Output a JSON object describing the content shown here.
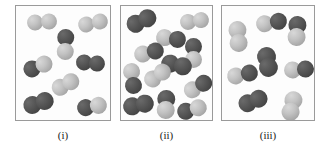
{
  "figure": {
    "type": "molecular-diagram",
    "background_color": "#ffffff",
    "panel_border_color": "#9a9a9a",
    "panel_fill_color": "#fdfdfd",
    "atom_colors": {
      "light": "#c3c3c3",
      "dark": "#575757",
      "mid": "#8b8b8b"
    },
    "panels": [
      {
        "id": "panel-i",
        "caption": "(i)",
        "box": {
          "x": 15,
          "y": 5,
          "width": 96,
          "height": 116
        },
        "molecule_count": 8,
        "molecules": [
          {
            "x": 11,
            "y": 8,
            "w": 30,
            "h": 16,
            "rot": -4,
            "left": "light",
            "right": "light"
          },
          {
            "x": 62,
            "y": 9,
            "w": 30,
            "h": 16,
            "rot": -12,
            "left": "light",
            "right": "light"
          },
          {
            "x": 41,
            "y": 23,
            "w": 17,
            "h": 31,
            "rot": 2,
            "left": "dark",
            "right": "light",
            "vertical": true
          },
          {
            "x": 7,
            "y": 52,
            "w": 30,
            "h": 17,
            "rot": -22,
            "left": "dark",
            "right": "light"
          },
          {
            "x": 60,
            "y": 49,
            "w": 29,
            "h": 16,
            "rot": 5,
            "left": "dark",
            "right": "dark"
          },
          {
            "x": 35,
            "y": 70,
            "w": 29,
            "h": 17,
            "rot": -28,
            "left": "light",
            "right": "light"
          },
          {
            "x": 7,
            "y": 88,
            "w": 31,
            "h": 18,
            "rot": -18,
            "left": "dark",
            "right": "dark"
          },
          {
            "x": 61,
            "y": 92,
            "w": 30,
            "h": 17,
            "rot": -10,
            "left": "dark",
            "right": "light"
          }
        ]
      },
      {
        "id": "panel-ii",
        "caption": "(ii)",
        "box": {
          "x": 120,
          "y": 5,
          "width": 93,
          "height": 116
        },
        "molecule_count": 12,
        "molecules": [
          {
            "x": 5,
            "y": 6,
            "w": 31,
            "h": 18,
            "rot": -25,
            "left": "dark",
            "right": "dark"
          },
          {
            "x": 59,
            "y": 7,
            "w": 29,
            "h": 16,
            "rot": -8,
            "left": "light",
            "right": "light"
          },
          {
            "x": 35,
            "y": 24,
            "w": 30,
            "h": 17,
            "rot": 8,
            "left": "light",
            "right": "dark"
          },
          {
            "x": 13,
            "y": 38,
            "w": 30,
            "h": 17,
            "rot": -14,
            "left": "light",
            "right": "dark"
          },
          {
            "x": 64,
            "y": 32,
            "w": 17,
            "h": 30,
            "rot": 0,
            "left": "dark",
            "right": "light",
            "vertical": true
          },
          {
            "x": 40,
            "y": 50,
            "w": 31,
            "h": 18,
            "rot": 12,
            "left": "dark",
            "right": "dark"
          },
          {
            "x": 3,
            "y": 57,
            "w": 17,
            "h": 31,
            "rot": -8,
            "left": "light",
            "right": "dark",
            "vertical": true
          },
          {
            "x": 22,
            "y": 61,
            "w": 29,
            "h": 17,
            "rot": -35,
            "left": "light",
            "right": "light"
          },
          {
            "x": 62,
            "y": 72,
            "w": 30,
            "h": 17,
            "rot": -30,
            "left": "light",
            "right": "dark"
          },
          {
            "x": 2,
            "y": 90,
            "w": 31,
            "h": 18,
            "rot": -12,
            "left": "dark",
            "right": "dark"
          },
          {
            "x": 36,
            "y": 84,
            "w": 18,
            "h": 29,
            "rot": 3,
            "left": "dark",
            "right": "light",
            "vertical": true
          },
          {
            "x": 56,
            "y": 95,
            "w": 30,
            "h": 17,
            "rot": -16,
            "left": "dark",
            "right": "light"
          }
        ]
      },
      {
        "id": "panel-iii",
        "caption": "(iii)",
        "box": {
          "x": 221,
          "y": 5,
          "width": 94,
          "height": 116
        },
        "molecule_count": 8,
        "molecules": [
          {
            "x": 7,
            "y": 15,
            "w": 18,
            "h": 31,
            "rot": -5,
            "left": "light",
            "right": "light",
            "vertical": true
          },
          {
            "x": 34,
            "y": 8,
            "w": 31,
            "h": 17,
            "rot": -10,
            "left": "light",
            "right": "dark"
          },
          {
            "x": 66,
            "y": 10,
            "w": 18,
            "h": 30,
            "rot": 4,
            "left": "dark",
            "right": "light",
            "vertical": true
          },
          {
            "x": 36,
            "y": 41,
            "w": 19,
            "h": 30,
            "rot": -10,
            "left": "dark",
            "right": "dark",
            "vertical": true
          },
          {
            "x": 5,
            "y": 60,
            "w": 31,
            "h": 17,
            "rot": -12,
            "left": "light",
            "right": "dark"
          },
          {
            "x": 62,
            "y": 55,
            "w": 30,
            "h": 17,
            "rot": -4,
            "left": "light",
            "right": "dark"
          },
          {
            "x": 16,
            "y": 86,
            "w": 30,
            "h": 18,
            "rot": -22,
            "left": "dark",
            "right": "dark"
          },
          {
            "x": 61,
            "y": 85,
            "w": 18,
            "h": 30,
            "rot": 14,
            "left": "light",
            "right": "light",
            "vertical": true
          }
        ]
      }
    ],
    "captions": [
      {
        "text": "(i)",
        "x": 15,
        "width": 96,
        "y": 128
      },
      {
        "text": "(ii)",
        "x": 120,
        "width": 93,
        "y": 128
      },
      {
        "text": "(iii)",
        "x": 221,
        "width": 94,
        "y": 128
      }
    ]
  }
}
